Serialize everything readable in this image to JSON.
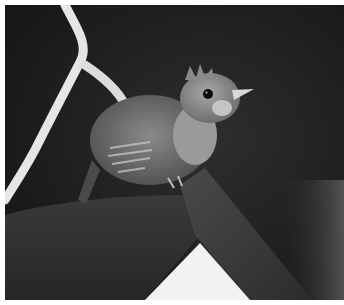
{
  "image": {
    "subject": "juvenile bird perched on wooden board",
    "style": "black-and-white photograph",
    "background_color": "#1b1b1b",
    "border_color": "#ffffff"
  }
}
